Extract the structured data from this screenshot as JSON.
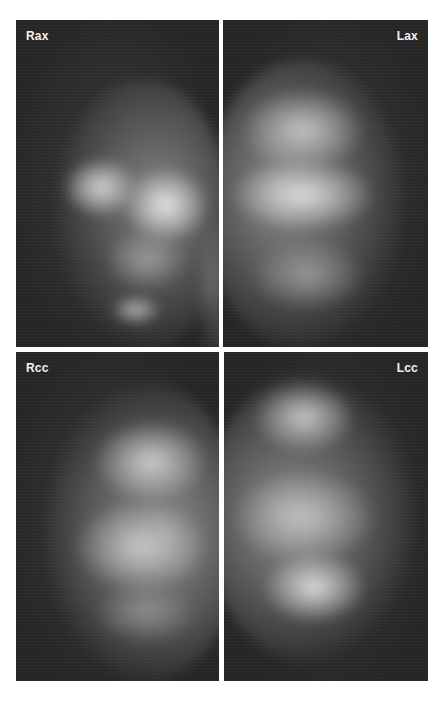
{
  "figure": {
    "panels": [
      {
        "id": "rax",
        "label": "Rax",
        "label_position": "top-left",
        "description": "Right axillary mammogram view"
      },
      {
        "id": "lax",
        "label": "Lax",
        "label_position": "top-right",
        "description": "Left axillary mammogram view"
      },
      {
        "id": "rcc",
        "label": "Rcc",
        "label_position": "top-left",
        "description": "Right craniocaudal mammogram view"
      },
      {
        "id": "lcc",
        "label": "Lcc",
        "label_position": "top-right",
        "description": "Left craniocaudal mammogram view"
      }
    ],
    "colors": {
      "background": "#ffffff",
      "panel_background": "#2b2b2b",
      "tissue_highlight": "#e6e6e6",
      "label_text": "#f2f2f2"
    }
  }
}
